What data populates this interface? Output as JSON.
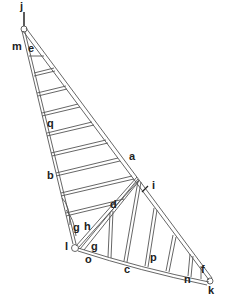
{
  "diagram": {
    "stroke_color": "#555555",
    "labels": {
      "a": "a",
      "b": "b",
      "c": "c",
      "d": "d",
      "e": "e",
      "f": "f",
      "g1": "g",
      "g2": "g",
      "h": "h",
      "i": "i",
      "j": "j",
      "k": "k",
      "l": "l",
      "m": "m",
      "n": "n",
      "o": "o",
      "p": "p",
      "q": "q"
    }
  }
}
